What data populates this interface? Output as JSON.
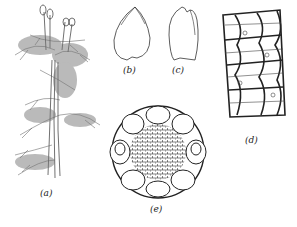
{
  "figure": {
    "panels": [
      {
        "id": "a",
        "label": "(a)",
        "subject": "whole moss plant with sporophytes"
      },
      {
        "id": "b",
        "label": "(b)",
        "subject": "leaf outline"
      },
      {
        "id": "c",
        "label": "(c)",
        "subject": "leaf outline"
      },
      {
        "id": "d",
        "label": "(d)",
        "subject": "leaf cell network"
      },
      {
        "id": "e",
        "label": "(e)",
        "subject": "stem cross-section"
      }
    ]
  },
  "colors": {
    "ink": "#2a2a2a",
    "background": "#ffffff"
  }
}
